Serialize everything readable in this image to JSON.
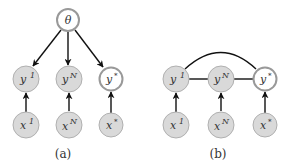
{
  "colors": {
    "observed_fill": "#d9d9d9",
    "observed_stroke": "#aaaaaa",
    "latent_fill": "#ffffff",
    "latent_stroke": "#999999",
    "edge": "#111111",
    "text": "#333333"
  },
  "panel_a": {
    "caption": "(a)",
    "nodes": {
      "theta": {
        "label": "θ"
      },
      "y1": {
        "base": "y",
        "sup": "1"
      },
      "yN": {
        "base": "y",
        "sup": "N"
      },
      "ystar": {
        "base": "y",
        "sup": "*"
      },
      "x1": {
        "base": "x",
        "sup": "1"
      },
      "xN": {
        "base": "x",
        "sup": "N"
      },
      "xstar": {
        "base": "x",
        "sup": "*"
      }
    },
    "edges": [
      {
        "from": "theta",
        "to": "y1",
        "type": "directed"
      },
      {
        "from": "theta",
        "to": "yN",
        "type": "directed"
      },
      {
        "from": "theta",
        "to": "ystar",
        "type": "directed"
      },
      {
        "from": "x1",
        "to": "y1",
        "type": "directed"
      },
      {
        "from": "xN",
        "to": "yN",
        "type": "directed"
      },
      {
        "from": "xstar",
        "to": "ystar",
        "type": "directed"
      }
    ]
  },
  "panel_b": {
    "caption": "(b)",
    "nodes": {
      "y1": {
        "base": "y",
        "sup": "1"
      },
      "yN": {
        "base": "y",
        "sup": "N"
      },
      "ystar": {
        "base": "y",
        "sup": "*"
      },
      "x1": {
        "base": "x",
        "sup": "1"
      },
      "xN": {
        "base": "x",
        "sup": "N"
      },
      "xstar": {
        "base": "x",
        "sup": "*"
      }
    },
    "edges": [
      {
        "from": "y1",
        "to": "yN",
        "type": "undirected"
      },
      {
        "from": "yN",
        "to": "ystar",
        "type": "undirected"
      },
      {
        "from": "y1",
        "to": "ystar",
        "type": "undirected-arc"
      },
      {
        "from": "x1",
        "to": "y1",
        "type": "directed"
      },
      {
        "from": "xN",
        "to": "yN",
        "type": "directed"
      },
      {
        "from": "xstar",
        "to": "ystar",
        "type": "directed"
      }
    ]
  }
}
